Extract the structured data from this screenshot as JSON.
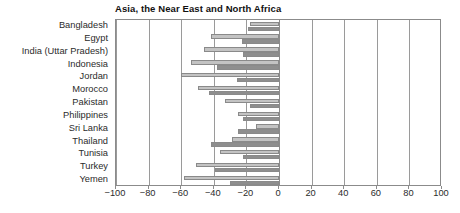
{
  "chart_data": {
    "type": "bar",
    "orientation": "horizontal",
    "title": "Asia, the Near East and North Africa",
    "xlabel": "",
    "ylabel": "",
    "xlim": [
      -100,
      100
    ],
    "xticks": [
      -100,
      -80,
      -60,
      -40,
      -20,
      0,
      20,
      40,
      60,
      80,
      100
    ],
    "xtick_labels": [
      "−100",
      "−80",
      "−60",
      "−40",
      "−20",
      "0",
      "20",
      "40",
      "60",
      "80",
      "100"
    ],
    "grid": true,
    "grid_axis": "x",
    "legend": "none",
    "categories": [
      "Bangladesh",
      "Egypt",
      "India (Uttar Pradesh)",
      "Indonesia",
      "Jordan",
      "Morocco",
      "Pakistan",
      "Philippines",
      "Sri Lanka",
      "Thailand",
      "Tunisia",
      "Turkey",
      "Yemen"
    ],
    "series": [
      {
        "name": "series-1",
        "color": "#c3c3c3",
        "values": [
          -18,
          -42,
          -46,
          -54,
          -60,
          -50,
          -33,
          -25,
          -14,
          -29,
          -36,
          -51,
          -58
        ]
      },
      {
        "name": "series-2",
        "color": "#8e8e8e",
        "values": [
          -19,
          -23,
          -22,
          -38,
          -26,
          -43,
          -18,
          -22,
          -25,
          -42,
          -22,
          -39,
          -30
        ]
      }
    ]
  },
  "colors": {
    "series_1": "#c3c3c3",
    "series_2": "#8e8e8e",
    "axis": "#8b8b8b",
    "grid": "#9a9a9a",
    "text": "#2b2b2b",
    "title": "#111111",
    "background": "#ffffff"
  }
}
